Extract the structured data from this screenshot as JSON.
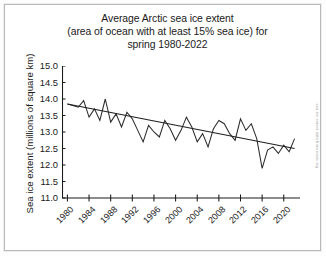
{
  "figure": {
    "title_lines": [
      "Average Arctic sea ice extent",
      "(area of ocean with at least 15% sea ice) for",
      "spring 1980-2022"
    ],
    "credit": "sea ice extent data from nsidc.org",
    "colors": {
      "series_line": "#2b2b2b",
      "trend_line": "#1f1f1f",
      "axis": "#1a1a1a",
      "paper": "#ffffff",
      "border": "#b9b9b9"
    }
  },
  "chart_data": {
    "type": "line",
    "title": "Average Arctic sea ice extent (area of ocean with at least 15% sea ice) for spring 1980-2022",
    "xlabel": "",
    "ylabel": "Sea ice extent (millions of square km)",
    "xlim": [
      1979,
      2023
    ],
    "ylim": [
      11.0,
      15.0
    ],
    "yticks": [
      11.0,
      11.5,
      12.0,
      12.5,
      13.0,
      13.5,
      14.0,
      14.5,
      15.0
    ],
    "ytick_labels": [
      "11.0",
      "11.5",
      "12.0",
      "12.5",
      "13.0",
      "13.5",
      "14.0",
      "14.5",
      "15.0"
    ],
    "xticks": [
      1980,
      1984,
      1988,
      1992,
      1996,
      2000,
      2004,
      2008,
      2012,
      2016,
      2020
    ],
    "xtick_labels": [
      "1980",
      "1984",
      "1988",
      "1992",
      "1996",
      "2000",
      "2004",
      "2008",
      "2012",
      "2016",
      "2020"
    ],
    "grid": false,
    "legend": "none",
    "series": [
      {
        "name": "Spring Arctic sea ice extent",
        "style": "zigzag-line",
        "x": [
          1980,
          1981,
          1982,
          1983,
          1984,
          1985,
          1986,
          1987,
          1988,
          1989,
          1990,
          1991,
          1992,
          1993,
          1994,
          1995,
          1996,
          1997,
          1998,
          1999,
          2000,
          2001,
          2002,
          2003,
          2004,
          2005,
          2006,
          2007,
          2008,
          2009,
          2010,
          2011,
          2012,
          2013,
          2014,
          2015,
          2016,
          2017,
          2018,
          2019,
          2020,
          2021,
          2022
        ],
        "values": [
          13.85,
          13.8,
          13.75,
          13.95,
          13.45,
          13.7,
          13.35,
          14.0,
          13.3,
          13.55,
          13.15,
          13.6,
          13.4,
          13.05,
          12.7,
          13.2,
          13.0,
          12.85,
          13.35,
          13.1,
          12.75,
          13.05,
          13.45,
          13.15,
          12.7,
          12.95,
          12.55,
          13.1,
          13.35,
          13.25,
          12.95,
          12.75,
          13.4,
          13.05,
          13.25,
          12.8,
          11.9,
          12.45,
          12.55,
          12.35,
          12.6,
          12.4,
          12.8
        ]
      },
      {
        "name": "Linear trend",
        "style": "straight-line",
        "x": [
          1980,
          2022
        ],
        "values": [
          13.85,
          12.5
        ]
      }
    ]
  }
}
